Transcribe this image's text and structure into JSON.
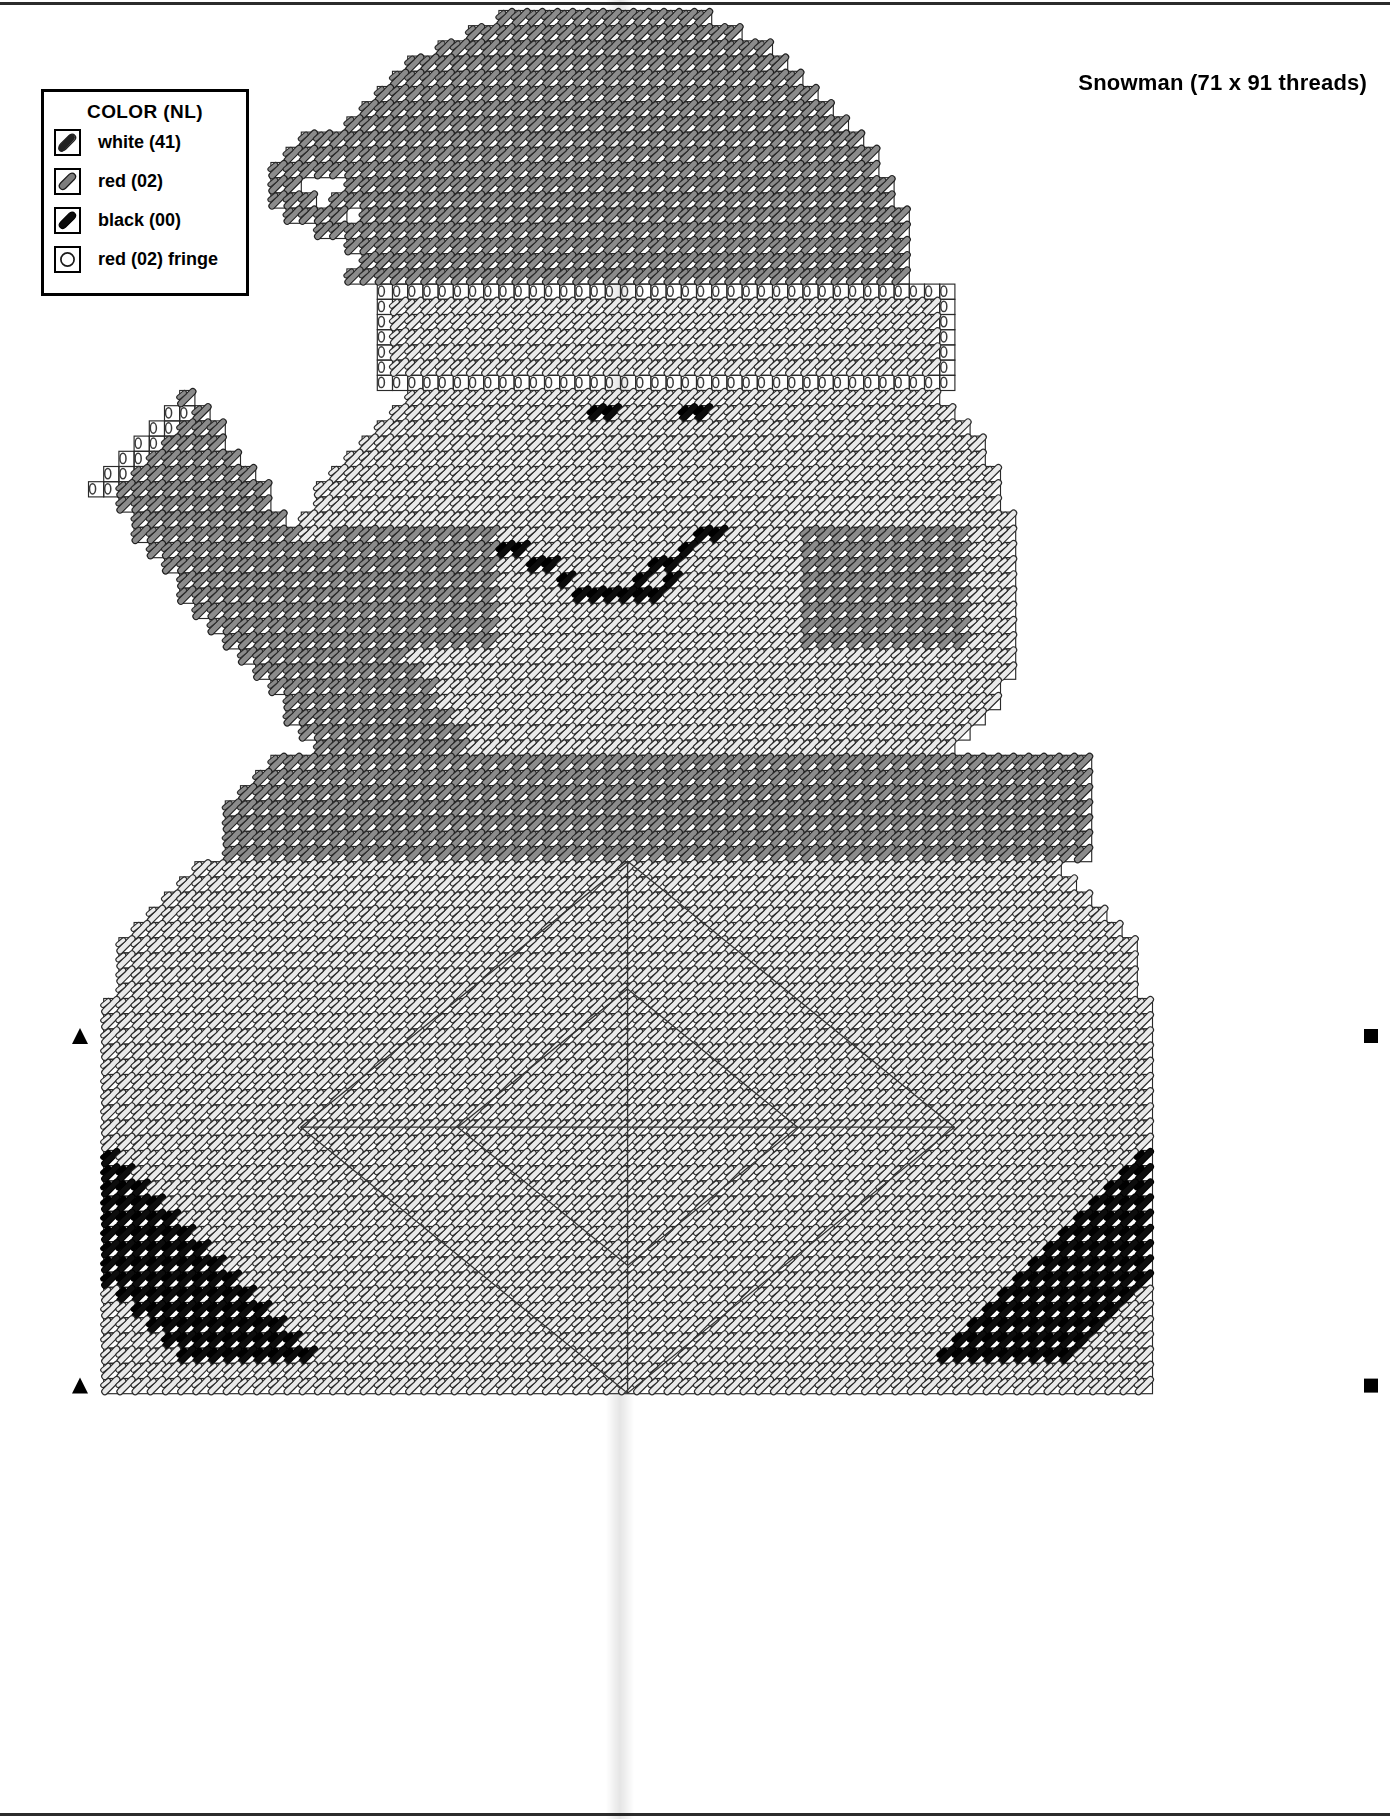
{
  "document": {
    "kind": "plastic-canvas-stitch-chart",
    "title": "Snowman (71 x 91 threads)",
    "threads_wide": 71,
    "threads_high": 91
  },
  "legend": {
    "heading": "COLOR (NL)",
    "items": [
      {
        "icon": "diagonal-stitch-white-icon",
        "label": "white (41)",
        "color": "#ffffff",
        "code": "41",
        "name": "white"
      },
      {
        "icon": "diagonal-stitch-red-icon",
        "label": "red (02)",
        "color": "#808080",
        "code": "02",
        "name": "red"
      },
      {
        "icon": "diagonal-stitch-black-icon",
        "label": "black (00)",
        "color": "#000000",
        "code": "00",
        "name": "black"
      },
      {
        "icon": "fringe-circle-icon",
        "label": "red (02) fringe",
        "color": "#808080",
        "code": "02",
        "name": "red fringe"
      }
    ]
  },
  "chart_data": {
    "type": "heatmap",
    "title": "Snowman (71 x 91 threads)",
    "xlabel": "",
    "ylabel": "",
    "grid": true,
    "legend_position": "top-left",
    "cols": 71,
    "rows": 91,
    "cell_px": 15.2,
    "origin": {
      "x": 88,
      "y": 10
    },
    "palette": {
      "white": "#ffffff",
      "red": "#8a8a8a",
      "black": "#111111",
      "outline": "#1a1a1a",
      "fringe": "#666666"
    },
    "regions": [
      {
        "name": "hat-cone",
        "color": "red",
        "desc": "Santa hat body, tall rounded cone with curled tip at left"
      },
      {
        "name": "hat-brim",
        "color": "white",
        "desc": "white fur brim band under hat"
      },
      {
        "name": "hat-fringe",
        "color": "fringe",
        "desc": "fringe loops along the brim top and right"
      },
      {
        "name": "head",
        "color": "white",
        "desc": "round snowman head"
      },
      {
        "name": "cheeks",
        "color": "red",
        "desc": "two red oval cheek patches"
      },
      {
        "name": "eyes",
        "color": "black",
        "desc": "two black eye stitches"
      },
      {
        "name": "mouth",
        "color": "black",
        "desc": "curved black mouth of 8 stitches"
      },
      {
        "name": "scarf",
        "color": "red",
        "desc": "red scarf band across neck"
      },
      {
        "name": "body",
        "color": "white",
        "desc": "large white snowman body / bag"
      },
      {
        "name": "diamond",
        "color": "white",
        "desc": "inner diamond outline quilt pattern"
      },
      {
        "name": "broom-handle",
        "color": "red",
        "desc": "diagonal broom handle at upper left"
      },
      {
        "name": "broom-fringe",
        "color": "fringe",
        "desc": "fringe at broom tip"
      },
      {
        "name": "mittens",
        "color": "black",
        "desc": "black stitch clusters at lower-left and lower-right corners"
      }
    ],
    "markers": [
      {
        "shape": "triangle",
        "side": "left",
        "row": 68
      },
      {
        "shape": "triangle",
        "side": "left",
        "row": 91
      },
      {
        "shape": "square",
        "side": "right",
        "row": 68
      },
      {
        "shape": "square",
        "side": "right",
        "row": 91
      }
    ]
  }
}
